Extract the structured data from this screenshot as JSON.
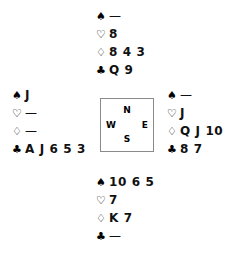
{
  "diagram": {
    "type": "bridge-deal-diagram",
    "suit_symbols": {
      "spades": "♠",
      "hearts": "♡",
      "diamonds": "♢",
      "clubs": "♣"
    },
    "void_mark": "—",
    "compass": {
      "north": "N",
      "east": "E",
      "south": "S",
      "west": "W"
    },
    "hands": {
      "north": {
        "spades": "—",
        "hearts": "8",
        "diamonds": "8 4 3",
        "clubs": "Q 9"
      },
      "west": {
        "spades": "J",
        "hearts": "—",
        "diamonds": "—",
        "clubs": "A J 6 5 3"
      },
      "east": {
        "spades": "—",
        "hearts": "J",
        "diamonds": "Q J 10",
        "clubs": "8 7"
      },
      "south": {
        "spades": "10 6 5",
        "hearts": "7",
        "diamonds": "K 7",
        "clubs": "—"
      }
    }
  }
}
